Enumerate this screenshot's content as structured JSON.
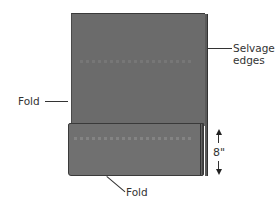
{
  "diagram": {
    "labels": {
      "selvage": "Selvage\nedges",
      "selvage_line1": "Selvage",
      "selvage_line2": "edges",
      "fold_left": "Fold",
      "fold_bottom": "Fold",
      "measurement": "8\""
    },
    "colors": {
      "fabric": "#6b6b6b",
      "flap": "#707070",
      "edge": "#3a3a3a",
      "text": "#333333",
      "background": "#ffffff"
    }
  }
}
